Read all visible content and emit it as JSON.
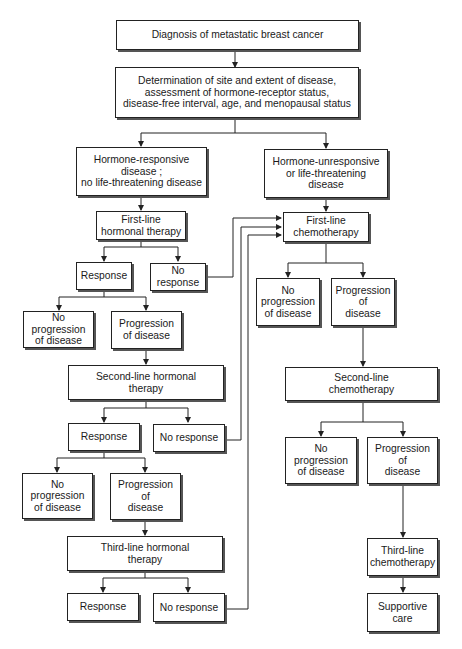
{
  "diagram": {
    "type": "flowchart",
    "title": "Diagnosis of metastatic breast cancer",
    "colors": {
      "line": "#222222",
      "box_fill": "#ffffff",
      "shadow": "#555555",
      "background": "#ffffff"
    },
    "nodes": {
      "diagnosis": "Diagnosis of metastatic breast cancer",
      "determination": "Determination of site and extent of disease,\nassessment of hormone-receptor status,\ndisease-free interval, age, and menopausal status",
      "hormone_responsive": "Hormone-responsive\ndisease ;\nno life-threatening disease",
      "hormone_unresponsive": "Hormone-unresponsive\nor life-threatening\ndisease",
      "first_line_hormonal": "First-line\nhormonal therapy",
      "first_line_chemo": "First-line\nchemotherapy",
      "response_1": "Response",
      "no_response_1": "No\nresponse",
      "no_progression_h1": "No progression\nof disease",
      "progression_h1": "Progression\nof disease",
      "chemo_no_progression_1": "No\nprogression\nof disease",
      "chemo_progression_1": "Progression\nof\ndisease",
      "second_line_hormonal": "Second-line hormonal\ntherapy",
      "second_line_chemo": "Second-line\nchemotherapy",
      "response_2": "Response",
      "no_response_2": "No response",
      "no_progression_h2": "No\nprogression\nof disease",
      "progression_h2": "Progression\nof\ndisease",
      "chemo_no_progression_2": "No\nprogression\nof disease",
      "chemo_progression_2": "Progression\nof\ndisease",
      "third_line_hormonal": "Third-line hormonal\ntherapy",
      "third_line_chemo": "Third-line\nchemotherapy",
      "response_3": "Response",
      "no_response_3": "No response",
      "supportive_care": "Supportive\ncare"
    },
    "edges": [
      [
        "diagnosis",
        "determination"
      ],
      [
        "determination",
        "hormone_responsive"
      ],
      [
        "determination",
        "hormone_unresponsive"
      ],
      [
        "hormone_responsive",
        "first_line_hormonal"
      ],
      [
        "hormone_unresponsive",
        "first_line_chemo"
      ],
      [
        "first_line_hormonal",
        "response_1"
      ],
      [
        "first_line_hormonal",
        "no_response_1"
      ],
      [
        "no_response_1",
        "first_line_chemo"
      ],
      [
        "response_1",
        "no_progression_h1"
      ],
      [
        "response_1",
        "progression_h1"
      ],
      [
        "progression_h1",
        "second_line_hormonal"
      ],
      [
        "second_line_hormonal",
        "response_2"
      ],
      [
        "second_line_hormonal",
        "no_response_2"
      ],
      [
        "no_response_2",
        "first_line_chemo"
      ],
      [
        "response_2",
        "no_progression_h2"
      ],
      [
        "response_2",
        "progression_h2"
      ],
      [
        "progression_h2",
        "third_line_hormonal"
      ],
      [
        "third_line_hormonal",
        "response_3"
      ],
      [
        "third_line_hormonal",
        "no_response_3"
      ],
      [
        "no_response_3",
        "first_line_chemo"
      ],
      [
        "first_line_chemo",
        "chemo_no_progression_1"
      ],
      [
        "first_line_chemo",
        "chemo_progression_1"
      ],
      [
        "chemo_progression_1",
        "second_line_chemo"
      ],
      [
        "second_line_chemo",
        "chemo_no_progression_2"
      ],
      [
        "second_line_chemo",
        "chemo_progression_2"
      ],
      [
        "chemo_progression_2",
        "third_line_chemo"
      ],
      [
        "third_line_chemo",
        "supportive_care"
      ]
    ]
  }
}
